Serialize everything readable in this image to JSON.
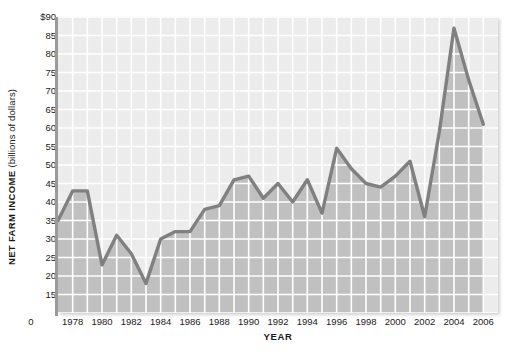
{
  "chart_data": {
    "type": "area",
    "title": "",
    "subtitle": "",
    "xlabel": "YEAR",
    "ylabel_main": "NET FARM INCOME",
    "ylabel_sub": "(billions of dollars)",
    "ylabel_full": "NET FARM INCOME (billions of dollars)",
    "grid": true,
    "legend": "none",
    "xlim": [
      1977,
      2007
    ],
    "ylim": [
      10,
      90
    ],
    "y_tick_labels": [
      "$90",
      "85",
      "80",
      "75",
      "70",
      "65",
      "60",
      "55",
      "50",
      "45",
      "40",
      "35",
      "30",
      "25",
      "20",
      "15"
    ],
    "y_tick_values": [
      90,
      85,
      80,
      75,
      70,
      65,
      60,
      55,
      50,
      45,
      40,
      35,
      30,
      25,
      20,
      15
    ],
    "y_origin_label": "0",
    "x_tick_labels": [
      "1978",
      "1980",
      "1982",
      "1984",
      "1986",
      "1988",
      "1990",
      "1992",
      "1994",
      "1996",
      "1998",
      "2000",
      "2002",
      "2004",
      "2006"
    ],
    "x_tick_values": [
      1978,
      1980,
      1982,
      1984,
      1986,
      1988,
      1990,
      1992,
      1994,
      1996,
      1998,
      2000,
      2002,
      2004,
      2006
    ],
    "x": [
      1977,
      1978,
      1979,
      1980,
      1981,
      1982,
      1983,
      1984,
      1985,
      1986,
      1987,
      1988,
      1989,
      1990,
      1991,
      1992,
      1993,
      1994,
      1995,
      1996,
      1997,
      1998,
      1999,
      2000,
      2001,
      2002,
      2003,
      2004,
      2005,
      2006
    ],
    "values": [
      35,
      43,
      43,
      23,
      31,
      26,
      18,
      30,
      32,
      32,
      38,
      39,
      46,
      47,
      41,
      45,
      40,
      46,
      37,
      54.5,
      49,
      45,
      44,
      47,
      51,
      36,
      59,
      87,
      73,
      61
    ],
    "series": [
      {
        "name": "Net farm income",
        "values": [
          35,
          43,
          43,
          23,
          31,
          26,
          18,
          30,
          32,
          32,
          38,
          39,
          46,
          47,
          41,
          45,
          40,
          46,
          37,
          54.5,
          49,
          45,
          44,
          47,
          51,
          36,
          59,
          87,
          73,
          61
        ]
      }
    ],
    "colors": {
      "plot_background": "#ececec",
      "area_fill": "#c0c0c0",
      "line": "#808080",
      "gridline": "#ffffff",
      "axis": "#9a9a9a",
      "text": "#1a1a1a"
    },
    "gridline_spacing_x_years": 1,
    "gridline_spacing_y_units": 5
  }
}
